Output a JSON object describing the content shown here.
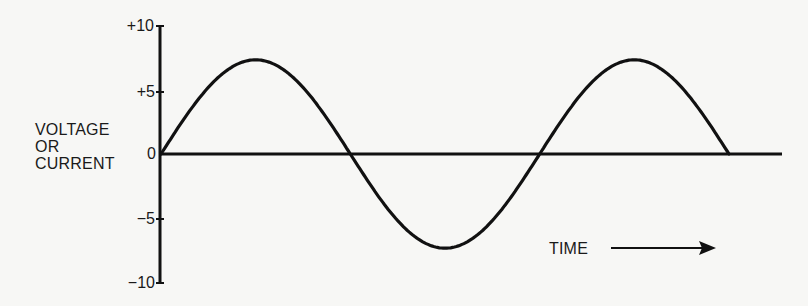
{
  "chart_data": {
    "type": "line",
    "title": "",
    "ylabel": "VOLTAGE OR CURRENT",
    "ylabel_lines": [
      "VOLTAGE",
      "OR",
      "CURRENT"
    ],
    "xlabel": "TIME",
    "y_ticks": [
      "+10",
      "+5",
      "0",
      "-5",
      "-10"
    ],
    "ylim": [
      -10,
      10
    ],
    "grid": false,
    "series": [
      {
        "name": "AC sine wave",
        "shape": "sine",
        "amplitude": 7.3,
        "cycles": 1.5,
        "points": [
          [
            0,
            0
          ],
          [
            0.25,
            7.3
          ],
          [
            0.5,
            0
          ],
          [
            0.75,
            -7.3
          ],
          [
            1.0,
            0
          ],
          [
            1.25,
            7.3
          ],
          [
            1.5,
            0
          ]
        ]
      }
    ]
  },
  "axis": {
    "y_label_lines": [
      "VOLTAGE",
      "OR",
      "CURRENT"
    ],
    "ticks": {
      "p10": "+10",
      "p5": "+5",
      "zero": "0",
      "m5": "−5",
      "m10": "−10"
    },
    "time_label": "TIME"
  }
}
